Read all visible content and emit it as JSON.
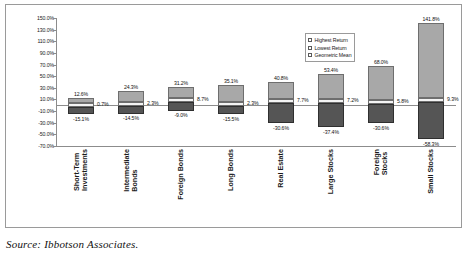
{
  "source_note": "Source: Ibbotson Associates.",
  "legend": {
    "position": "inside-top-right",
    "items": [
      {
        "key": "highest",
        "label": "Highest Return",
        "color": "#a8a8a8"
      },
      {
        "key": "lowest",
        "label": "Lowest Return",
        "color": "#555555"
      },
      {
        "key": "mean",
        "label": "Geometric Mean",
        "color": "#ffffff"
      }
    ]
  },
  "chart_data": {
    "type": "bar",
    "subtype": "floating-range-bar",
    "title": "",
    "subtitle": "",
    "xlabel": "",
    "ylabel": "",
    "ylim": [
      -70,
      150
    ],
    "ytick_step": 20,
    "grid": false,
    "legend_position": "inside-top-right",
    "categories": [
      "Short-Term Investments",
      "Intermediate Bonds",
      "Foreign Bonds",
      "Long Bonds",
      "Real Estate",
      "Large Stocks",
      "Foreign Stocks",
      "Small Stocks"
    ],
    "ytick_labels": [
      "150.0%",
      "130.0%",
      "110.0%",
      "90.0%",
      "70.0%",
      "50.0%",
      "30.0%",
      "10.0%",
      "-10.0%",
      "-30.0%",
      "-50.0%",
      "-70.0%"
    ],
    "ytick_values": [
      150,
      130,
      110,
      90,
      70,
      50,
      30,
      10,
      -10,
      -30,
      -50,
      -70
    ],
    "series": [
      {
        "name": "Highest Return",
        "color": "#a8a8a8",
        "values": [
          12.6,
          24.3,
          31.2,
          35.1,
          40.8,
          53.4,
          68.0,
          141.8
        ],
        "labels": [
          "12.6%",
          "24.3%",
          "31.2%",
          "35.1%",
          "40.8%",
          "53.4%",
          "68.0%",
          "141.8%"
        ]
      },
      {
        "name": "Lowest Return",
        "color": "#555555",
        "values": [
          -15.1,
          -14.5,
          -9.0,
          -15.5,
          -30.6,
          -37.4,
          -30.6,
          -58.3
        ],
        "labels": [
          "-15.1%",
          "-14.5%",
          "-9.0%",
          "-15.5%",
          "-30.6%",
          "-37.4%",
          "-30.6%",
          "-58.3%"
        ]
      },
      {
        "name": "Geometric Mean",
        "color": "#ffffff",
        "values": [
          0.7,
          2.3,
          8.7,
          2.3,
          7.7,
          7.2,
          5.8,
          9.3
        ],
        "labels": [
          "0.7%",
          "2.3%",
          "8.7%",
          "2.3%",
          "7.7%",
          "7.2%",
          "5.8%",
          "9.3%"
        ]
      }
    ]
  }
}
